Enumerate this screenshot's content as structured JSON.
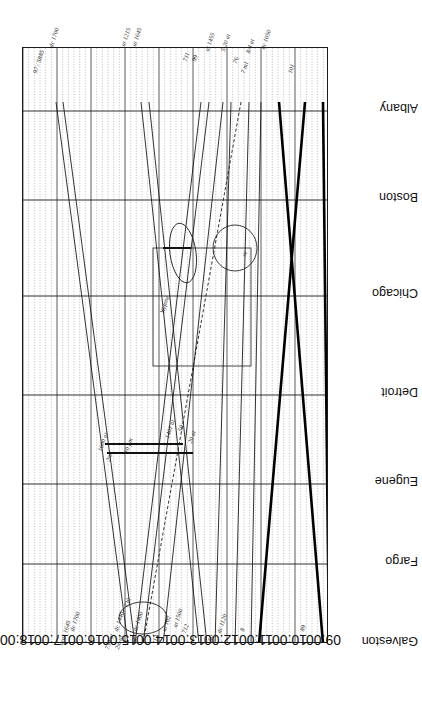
{
  "figure": {
    "kind": "train-string-diagram",
    "orientation_note": "whole figure printed upside-down (rotated 180 degrees)",
    "axis_line_color": "#1a1a1a",
    "grid_minor_color": "#8f8f8f",
    "grid_major_color": "#4a4a4a",
    "train_line_color": "#111111",
    "heavy_line_color": "#000000"
  },
  "yaxis": {
    "name": "stations",
    "labels": [
      "Albany",
      "Boston",
      "Chicago",
      "Detroit",
      "Eugene",
      "Fargo",
      "Galveston"
    ],
    "positions_px": [
      63,
      152,
      248,
      347,
      436,
      516,
      596
    ]
  },
  "xaxis": {
    "name": "time-of-day",
    "labels": [
      "18:00",
      "17:00",
      "16:00",
      "15:00",
      "14:00",
      "13:00",
      "12:00",
      "11:00",
      "10:00",
      "09:00"
    ],
    "minor_per_hour": 6,
    "range": [
      "18:00",
      "09:00"
    ],
    "direction": "right-to-left (rotated)"
  },
  "chart_data": {
    "type": "line",
    "title": "",
    "xlabel": "",
    "ylabel": "",
    "x": [
      "18:00",
      "17:00",
      "16:00",
      "15:00",
      "14:00",
      "13:00",
      "12:00",
      "11:00",
      "10:00",
      "09:00"
    ],
    "categories": [
      "Albany",
      "Boston",
      "Chicago",
      "Detroit",
      "Eugene",
      "Fargo",
      "Galveston"
    ],
    "series": [
      {
        "name": "97 / 5885",
        "style": "solid",
        "weight": "thin",
        "points": [
          [
            33,
            54
          ],
          [
            105,
            596
          ]
        ]
      },
      {
        "name": "97 second leg",
        "style": "solid",
        "weight": "thin",
        "points": [
          [
            40,
            54
          ],
          [
            112,
            596
          ]
        ]
      },
      {
        "name": "711",
        "style": "solid",
        "weight": "thin",
        "points": [
          [
            178,
            54
          ],
          [
            112,
            596
          ]
        ]
      },
      {
        "name": "99",
        "style": "solid",
        "weight": "thin",
        "points": [
          [
            186,
            54
          ],
          [
            120,
            596
          ]
        ]
      },
      {
        "name": "at 1215",
        "style": "solid",
        "weight": "thin",
        "points": [
          [
            118,
            54
          ],
          [
            176,
            596
          ]
        ]
      },
      {
        "name": "at 1645",
        "style": "solid",
        "weight": "thin",
        "points": [
          [
            126,
            54
          ],
          [
            184,
            596
          ]
        ]
      },
      {
        "name": "at 1455",
        "style": "solid",
        "weight": "thin",
        "points": [
          [
            200,
            54
          ],
          [
            140,
            596
          ]
        ]
      },
      {
        "name": "712",
        "style": "solid",
        "weight": "thin",
        "points": [
          [
            208,
            54
          ],
          [
            192,
            596
          ]
        ]
      },
      {
        "name": "5 20 at",
        "style": "dashed",
        "weight": "thin",
        "points": [
          [
            218,
            54
          ],
          [
            120,
            596
          ]
        ]
      },
      {
        "name": "76",
        "style": "solid",
        "weight": "thin",
        "points": [
          [
            226,
            54
          ],
          [
            212,
            596
          ]
        ]
      },
      {
        "name": "7 m1 / 8/4 at",
        "style": "solid",
        "weight": "thin",
        "points": [
          [
            238,
            54
          ],
          [
            228,
            596
          ]
        ]
      },
      {
        "name": "50",
        "style": "solid",
        "weight": "heavy",
        "points": [
          [
            256,
            54
          ],
          [
            300,
            596
          ]
        ]
      },
      {
        "name": "101",
        "style": "solid",
        "weight": "heavy",
        "points": [
          [
            282,
            54
          ],
          [
            236,
            596
          ]
        ]
      },
      {
        "name": "89",
        "style": "solid",
        "weight": "heavy",
        "points": [
          [
            300,
            54
          ],
          [
            306,
            596
          ]
        ]
      }
    ],
    "conflict_markers": [
      {
        "shape": "ellipse",
        "label": "Chicago meet",
        "cx": 160,
        "cy": 205,
        "rx": 13,
        "ry": 30,
        "rot": -8
      },
      {
        "shape": "ellipse",
        "label": "Chicago pass",
        "cx": 212,
        "cy": 200,
        "rx": 22,
        "ry": 23,
        "rot": 0
      },
      {
        "shape": "ellipse",
        "label": "Galveston meet",
        "cx": 120,
        "cy": 570,
        "rx": 24,
        "ry": 16,
        "rot": 0
      }
    ],
    "highlight_boxes": [
      {
        "label": "Detroit-Chicago window",
        "x": 130,
        "y": 200,
        "w": 98,
        "h": 118
      }
    ],
    "dwell_bars": [
      {
        "label": "Eugene hold A",
        "x1": 82,
        "x2": 160,
        "y": 396
      },
      {
        "label": "Eugene hold B",
        "x1": 84,
        "x2": 170,
        "y": 405
      },
      {
        "label": "Chicago hold",
        "x1": 140,
        "x2": 168,
        "y": 200
      }
    ]
  },
  "annotations": [
    {
      "id": "ann-97-5885",
      "text": "97 / 5885",
      "x": 31,
      "y": 72,
      "rot": -72
    },
    {
      "id": "ann-dc1700",
      "text": "dc 1700",
      "x": 47,
      "y": 46,
      "rot": -72
    },
    {
      "id": "ann-at1215",
      "text": "at 1215",
      "x": 119,
      "y": 45,
      "rot": -72
    },
    {
      "id": "ann-at1645",
      "text": "at 1645",
      "x": 130,
      "y": 45,
      "rot": -72
    },
    {
      "id": "ann-711",
      "text": "711",
      "x": 181,
      "y": 60,
      "rot": -72
    },
    {
      "id": "ann-99",
      "text": "99",
      "x": 190,
      "y": 60,
      "rot": -72
    },
    {
      "id": "ann-at1455",
      "text": "at 1455",
      "x": 203,
      "y": 50,
      "rot": -72
    },
    {
      "id": "ann-520at",
      "text": "5 20 at",
      "x": 219,
      "y": 50,
      "rot": -72
    },
    {
      "id": "ann-76",
      "text": "76",
      "x": 231,
      "y": 62,
      "rot": -72
    },
    {
      "id": "ann-7m1",
      "text": "7 m1",
      "x": 239,
      "y": 72,
      "rot": -72
    },
    {
      "id": "ann-84at",
      "text": "8/4 at",
      "x": 244,
      "y": 52,
      "rot": -72
    },
    {
      "id": "ann-dc1050",
      "text": "dc 1050",
      "x": 259,
      "y": 48,
      "rot": -72
    },
    {
      "id": "ann-101",
      "text": "101",
      "x": 286,
      "y": 72,
      "rot": -72
    },
    {
      "id": "ann-1600at",
      "text": "1600 at",
      "x": 96,
      "y": 450,
      "rot": -72
    },
    {
      "id": "ann-2m",
      "text": "2m",
      "x": 104,
      "y": 460,
      "rot": -72
    },
    {
      "id": "ann-10pm",
      "text": "10 pm",
      "x": 122,
      "y": 452,
      "rot": -72
    },
    {
      "id": "ann-1401at",
      "text": "1401 at",
      "x": 163,
      "y": 437,
      "rot": -72
    },
    {
      "id": "ann-50",
      "text": "50",
      "x": 176,
      "y": 430,
      "rot": -72
    },
    {
      "id": "ann-20at",
      "text": "20 at",
      "x": 186,
      "y": 442,
      "rot": -72
    },
    {
      "id": "ann-wyfone",
      "text": "Wyfone",
      "x": 158,
      "y": 312,
      "rot": -72
    },
    {
      "id": "ann-re",
      "text": "re",
      "x": 240,
      "y": 255,
      "rot": -72
    },
    {
      "id": "ann-ar1645",
      "text": "arar 1645",
      "x": 57,
      "y": 644,
      "rot": -72
    },
    {
      "id": "ann-dc1700b",
      "text": "dc 1700",
      "x": 68,
      "y": 630,
      "rot": -72
    },
    {
      "id": "ann-730at",
      "text": "730 at",
      "x": 103,
      "y": 648,
      "rot": -72
    },
    {
      "id": "ann-2mat",
      "text": "2m at",
      "x": 113,
      "y": 648,
      "rot": -72
    },
    {
      "id": "ann-730",
      "text": "730",
      "x": 122,
      "y": 606,
      "rot": -72
    },
    {
      "id": "ann-dc1440",
      "text": "dc 1440",
      "x": 112,
      "y": 630,
      "rot": -72
    },
    {
      "id": "ann-dc1400",
      "text": "dc 1400",
      "x": 131,
      "y": 630,
      "rot": -72
    },
    {
      "id": "ann-13",
      "text": "13",
      "x": 151,
      "y": 640,
      "rot": -72
    },
    {
      "id": "ann-at102",
      "text": "at 102",
      "x": 160,
      "y": 630,
      "rot": -72
    },
    {
      "id": "ann-at1500",
      "text": "at 1500",
      "x": 171,
      "y": 626,
      "rot": -72
    },
    {
      "id": "ann-712b",
      "text": "712",
      "x": 180,
      "y": 632,
      "rot": -72
    },
    {
      "id": "ann-dc1120",
      "text": "dc 1120",
      "x": 215,
      "y": 632,
      "rot": -72
    },
    {
      "id": "ann-50b",
      "text": "50",
      "x": 206,
      "y": 640,
      "rot": -72
    },
    {
      "id": "ann-8",
      "text": "8",
      "x": 238,
      "y": 630,
      "rot": -72
    },
    {
      "id": "ann-89",
      "text": "89",
      "x": 298,
      "y": 630,
      "rot": -72
    }
  ]
}
